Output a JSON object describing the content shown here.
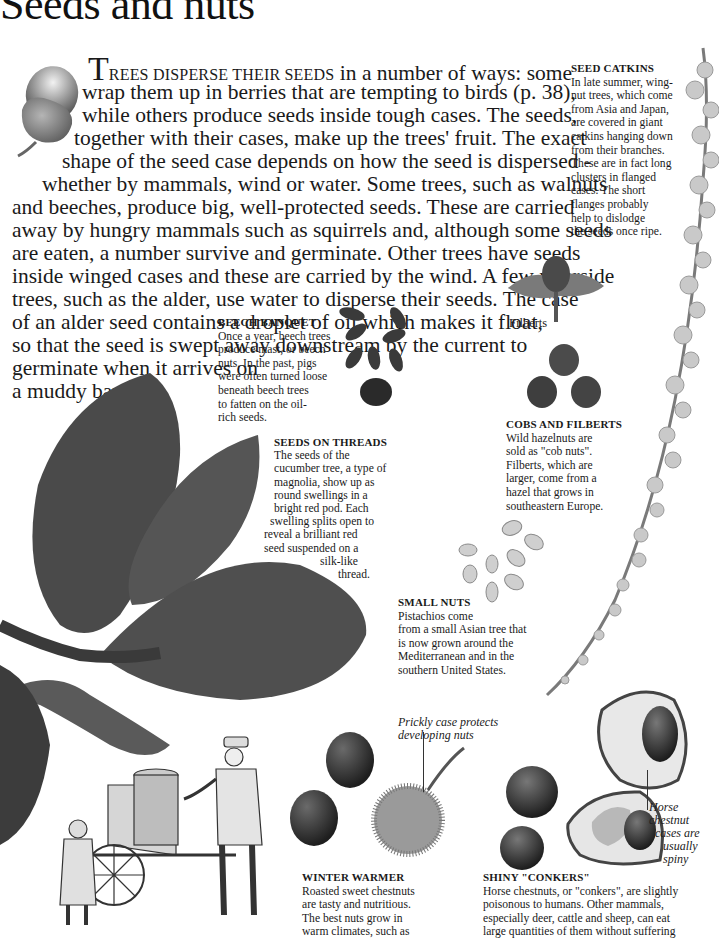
{
  "page": {
    "title": "Seeds and nuts",
    "intro": {
      "dropcap": "T",
      "smallcaps": "REES DISPERSE THEIR SEEDS",
      "lines": [
        " in a number of ways: some",
        "wrap them up in berries that are tempting to birds (p. 38),",
        "while others produce seeds inside tough cases. The seeds,",
        "together with their cases, make up the trees' fruit. The exact",
        "shape of the seed case depends on how the seed is dispersed -",
        "whether by mammals, wind or water. Some trees, such as walnuts",
        "and beeches, produce big, well-protected seeds. These are carried",
        "away by hungry mammals such as squirrels and, although some seeds",
        "are eaten, a number survive and germinate. Other trees have seeds",
        "inside winged cases and these are carried by the wind. A few riverside",
        "trees, such as the alder, use water to disperse their seeds. The case",
        "of an alder seed contains a droplet of oil which makes it float,",
        "so that the seed is swept away downstream by the current to",
        "germinate when it arrives on",
        "a muddy bank."
      ]
    },
    "captions": {
      "seed_catkins": {
        "heading": "SEED CATKINS",
        "lines": [
          "In late summer, wing-",
          "nut trees, which come",
          "from Asia and Japan,",
          "are covered in giant",
          "catkins hanging down",
          "from their branches.",
          "These are in fact long",
          "clusters in flanged",
          "cases. The short",
          "flanges probably",
          "help to dislodge",
          "the seeds once ripe."
        ]
      },
      "beech_banquet": {
        "heading": "BEECH BANQUET",
        "lines": [
          "Once a year, beech trees",
          "produce  mast, or beech",
          "nuts. In the past, pigs",
          "were often turned loose",
          "beneath beech trees",
          "to fatten on the oil-",
          "rich seeds."
        ]
      },
      "seeds_on_threads": {
        "heading": "SEEDS ON THREADS",
        "lines": [
          "The seeds of the",
          "cucumber tree, a type of",
          "magnolia, show up as",
          "round swellings in a",
          "bright red pod. Each",
          "swelling splits open to",
          "reveal a brilliant red",
          "seed suspended on a",
          "silk-like",
          "thread."
        ]
      },
      "filberts_label": "Filberts",
      "cobs_and_filberts": {
        "heading": "COBS AND FILBERTS",
        "lines": [
          "Wild hazelnuts are",
          "sold as \"cob nuts\".",
          "Filberts, which are",
          "larger, come from a",
          "hazel that grows in",
          "southeastern Europe."
        ]
      },
      "small_nuts": {
        "heading": "SMALL NUTS",
        "lines": [
          "Pistachios come",
          "from a small Asian tree that",
          "is now grown around the",
          "Mediterranean and in the",
          "southern United States."
        ]
      },
      "prickly_case": {
        "lines": [
          "Prickly case protects",
          "developing nuts"
        ]
      },
      "winter_warmer": {
        "heading": "WINTER WARMER",
        "lines": [
          "Roasted sweet chestnuts",
          "are tasty and nutritious.",
          "The best nuts grow in",
          "warm climates, such as"
        ]
      },
      "horse_chestnut_cases": {
        "lines": [
          "Horse chestnut",
          "cases are",
          "usually",
          "spiny"
        ]
      },
      "shiny_conkers": {
        "heading": "SHINY \"CONKERS\"",
        "lines": [
          "Horse chestnuts, or \"conkers\", are slightly",
          "poisonous to humans. Other mammals,",
          "especially deer, cattle and sheep, can eat",
          "large quantities of them without suffering"
        ]
      }
    },
    "colors": {
      "text": "#1a1a1a",
      "background": "#ffffff",
      "leaf": "#4a4a4a",
      "nut_dark": "#2e2e2e"
    }
  }
}
